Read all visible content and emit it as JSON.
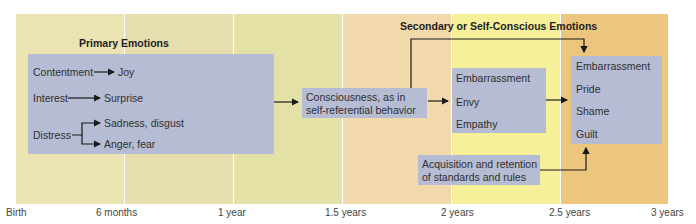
{
  "bands": [
    {
      "color": "#ebe3b2"
    },
    {
      "color": "#e6dfb0"
    },
    {
      "color": "#e2e1a6"
    },
    {
      "color": "#f1d8aa"
    },
    {
      "color": "#f4ef96"
    },
    {
      "color": "#ecc57d"
    }
  ],
  "timeline": {
    "ticks": [
      "Birth",
      "6 months",
      "1 year",
      "1.5 years",
      "2 years",
      "2.5 years",
      "3 years"
    ]
  },
  "primary": {
    "title": "Primary Emotions",
    "rows": [
      {
        "from": "Contentment",
        "to": [
          "Joy"
        ]
      },
      {
        "from": "Interest",
        "to": [
          "Surprise"
        ]
      },
      {
        "from": "Distress",
        "to": [
          "Sadness, disgust",
          "Anger, fear"
        ]
      }
    ]
  },
  "consciousness": {
    "line1": "Consciousness, as in",
    "line2": "self-referential behavior"
  },
  "secondary": {
    "title": "Secondary or Self-Conscious Emotions",
    "early": [
      "Embarrassment",
      "Envy",
      "Empathy"
    ],
    "late": [
      "Embarrassment",
      "Pride",
      "Shame",
      "Guilt"
    ]
  },
  "standards": {
    "line1": "Acquisition and retention",
    "line2": "of standards and rules"
  }
}
